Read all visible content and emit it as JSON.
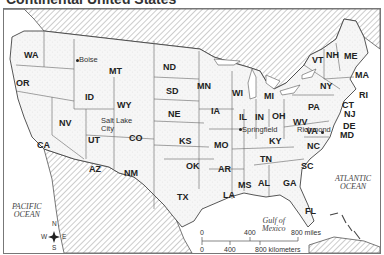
{
  "title": "Continental United States",
  "states": [
    {
      "abbr": "WA",
      "x": 20,
      "y": 42
    },
    {
      "abbr": "OR",
      "x": 12,
      "y": 70
    },
    {
      "abbr": "CA",
      "x": 33,
      "y": 132
    },
    {
      "abbr": "NV",
      "x": 55,
      "y": 110
    },
    {
      "abbr": "ID",
      "x": 81,
      "y": 84
    },
    {
      "abbr": "MT",
      "x": 105,
      "y": 58
    },
    {
      "abbr": "WY",
      "x": 113,
      "y": 92
    },
    {
      "abbr": "UT",
      "x": 84,
      "y": 127
    },
    {
      "abbr": "CO",
      "x": 125,
      "y": 125
    },
    {
      "abbr": "AZ",
      "x": 85,
      "y": 156
    },
    {
      "abbr": "NM",
      "x": 120,
      "y": 160
    },
    {
      "abbr": "ND",
      "x": 159,
      "y": 54
    },
    {
      "abbr": "SD",
      "x": 162,
      "y": 78
    },
    {
      "abbr": "NE",
      "x": 164,
      "y": 101
    },
    {
      "abbr": "KS",
      "x": 175,
      "y": 128
    },
    {
      "abbr": "OK",
      "x": 182,
      "y": 153
    },
    {
      "abbr": "TX",
      "x": 173,
      "y": 184
    },
    {
      "abbr": "MN",
      "x": 193,
      "y": 73
    },
    {
      "abbr": "IA",
      "x": 207,
      "y": 98
    },
    {
      "abbr": "MO",
      "x": 210,
      "y": 132
    },
    {
      "abbr": "AR",
      "x": 214,
      "y": 156
    },
    {
      "abbr": "LA",
      "x": 219,
      "y": 182
    },
    {
      "abbr": "WI",
      "x": 228,
      "y": 80
    },
    {
      "abbr": "IL",
      "x": 235,
      "y": 104
    },
    {
      "abbr": "MS",
      "x": 234,
      "y": 172
    },
    {
      "abbr": "MI",
      "x": 260,
      "y": 83
    },
    {
      "abbr": "IN",
      "x": 251,
      "y": 104
    },
    {
      "abbr": "OH",
      "x": 268,
      "y": 103
    },
    {
      "abbr": "KY",
      "x": 265,
      "y": 128
    },
    {
      "abbr": "TN",
      "x": 256,
      "y": 146
    },
    {
      "abbr": "AL",
      "x": 254,
      "y": 170
    },
    {
      "abbr": "GA",
      "x": 279,
      "y": 170
    },
    {
      "abbr": "FL",
      "x": 301,
      "y": 198
    },
    {
      "abbr": "SC",
      "x": 297,
      "y": 153
    },
    {
      "abbr": "NC",
      "x": 303,
      "y": 133
    },
    {
      "abbr": "VA",
      "x": 302,
      "y": 118
    },
    {
      "abbr": "WV",
      "x": 289,
      "y": 109
    },
    {
      "abbr": "PA",
      "x": 304,
      "y": 94
    },
    {
      "abbr": "NY",
      "x": 316,
      "y": 73
    },
    {
      "abbr": "VT",
      "x": 308,
      "y": 47
    },
    {
      "abbr": "NH",
      "x": 322,
      "y": 42
    },
    {
      "abbr": "ME",
      "x": 340,
      "y": 43
    },
    {
      "abbr": "MA",
      "x": 351,
      "y": 62
    },
    {
      "abbr": "RI",
      "x": 355,
      "y": 82
    },
    {
      "abbr": "CT",
      "x": 338,
      "y": 92
    },
    {
      "abbr": "NJ",
      "x": 340,
      "y": 101
    },
    {
      "abbr": "DE",
      "x": 339,
      "y": 113
    },
    {
      "abbr": "MD",
      "x": 336,
      "y": 122
    }
  ],
  "cities": [
    {
      "name": "Boise",
      "x": 75,
      "y": 47,
      "dot_x": 73,
      "dot_y": 51
    },
    {
      "name": "Salt Lake",
      "x": 97,
      "y": 108,
      "dot_x": 0,
      "dot_y": 0
    },
    {
      "name": "City",
      "x": 97,
      "y": 116,
      "dot_x": 0,
      "dot_y": 0
    },
    {
      "name": "Springfield",
      "x": 238,
      "y": 117,
      "dot_x": 236,
      "dot_y": 120
    },
    {
      "name": "Richmond",
      "x": 293,
      "y": 117,
      "dot_x": 318,
      "dot_y": 123
    }
  ],
  "oceans": [
    {
      "name_line1": "PACIFIC",
      "name_line2": "OCEAN",
      "x": 8,
      "y": 194
    },
    {
      "name_line1": "ATLANTIC",
      "name_line2": "OCEAN",
      "x": 331,
      "y": 166
    },
    {
      "name_line1": "Gulf of",
      "name_line2": "Mexico",
      "x": 258,
      "y": 208
    }
  ],
  "compass": {
    "n": "N",
    "s": "S",
    "e": "E",
    "w": "W"
  },
  "scale": {
    "miles_labels": [
      "0",
      "400",
      "800 miles"
    ],
    "km_labels": [
      "0",
      "400",
      "800 kilometers"
    ]
  },
  "colors": {
    "land": "#f4f4f4",
    "border": "#555555",
    "hatch": "#9a9a9a",
    "water": "#ffffff"
  }
}
